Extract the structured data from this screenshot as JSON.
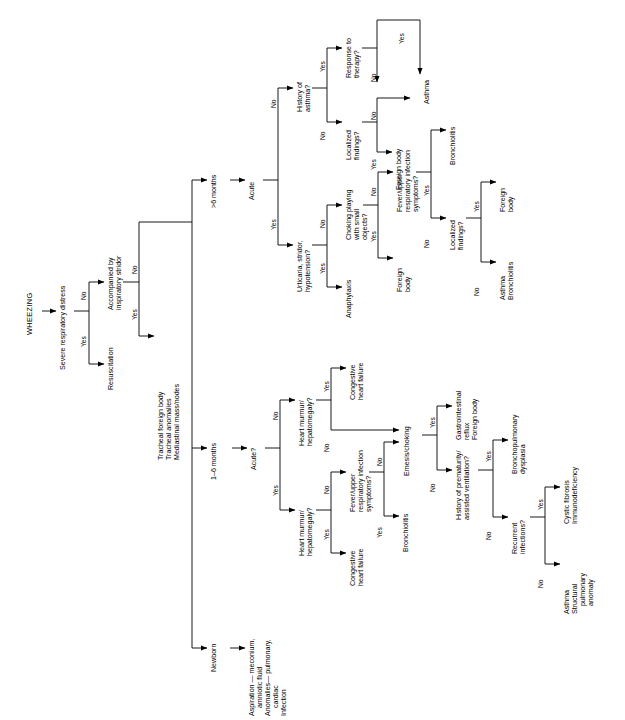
{
  "diagram": {
    "type": "clinical-decision-tree",
    "title": "WHEEZING",
    "orientation": "left-to-right, text rotated 90 degrees counter-clockwise",
    "colors": {
      "line": "#000000",
      "text": "#000000",
      "background": "#ffffff"
    },
    "answers": {
      "yes": "Yes",
      "no": "No"
    }
  },
  "nodes": {
    "root": "WHEEZING",
    "q_severe": "Severe respiratory distress",
    "t_resuscitation": "Resuscitation",
    "q_stridor": "Accompanied by\ninspiratory stridor",
    "t_tracheal": "Tracheal foreign body\nTracheal anomalies\nMediastinal mass/nodes",
    "age_gt6": ">6 months",
    "age_1to6": "1–6 months",
    "age_newborn": "Newborn",
    "t_newborn": "Aspiration — meconium,\n    amniotic fluid\nAnomalies— pulmonary,\n    cardiac\nInfection",
    "q_acute_top": "Acute",
    "q_urticaria": "Urticaria, stridor,\nhypotension?",
    "t_anaphylaxis": "Anaphylaxis",
    "q_choking": "Choking playing\nwith small\nobjects?",
    "t_foreign_body_1": "Foreign\nbody",
    "t_foreign_body_2": "Foreign body",
    "q_fever_uri_top": "Fever/upper\nrespiratory infection\nsymptoms?",
    "t_bronchiolitis_top": "Bronchiolitis",
    "q_localized_top": "Localized\nfindings?",
    "t_foreign_body_3": "Foreign\nbody",
    "t_asthma_bronchiolitis": "Asthma\nBronchiolitis",
    "q_hx_asthma": "History of\nasthma?",
    "q_response": "Response to\ntherapy?",
    "t_asthma_top": "Asthma",
    "q_localized_top2": "Localized\nfindings?",
    "t_foreign_body_top": "Foreign body",
    "q_acute_mid": "Acute?",
    "q_heart_yes": "Heart murmur/\nhepatomegaly?",
    "t_chf_1": "Congestive\nheart failure",
    "q_fever_uri_mid": "Fever/upper\nrespiratory infection\nsymptoms?",
    "t_bronchiolitis_mid": "Bronchiolitis",
    "q_heart_no": "Heart murmur/\nhepatomegaly?",
    "t_chf_2": "Congestive\nheart failure",
    "q_emesis": "Emesis/choking",
    "t_gerd": "Gastrointestinal\nreflux\nForeign body",
    "q_prematurity": "History of prematurity/\nassisted ventilation?",
    "t_bpd": "Bronchopulmonary\ndysplasia",
    "q_recurrent": "Recurrent\ninfections?",
    "t_cf": "Cystic fibrosis\nImmunodeficiency",
    "t_asthma_struct": "Asthma\nStructural\n    pulmonary\n    anomaly"
  },
  "edge_labels": {
    "severe_yes": "Yes",
    "severe_no": "No",
    "stridor_yes": "Yes",
    "stridor_no": "No",
    "acute_top_yes": "Yes",
    "acute_top_no": "No",
    "urticaria_yes": "Yes",
    "urticaria_no": "No",
    "choking_yes": "Yes",
    "choking_no": "No",
    "fever_top_yes": "Yes",
    "fever_top_no": "No",
    "localized_top_yes": "Yes",
    "localized_top_no": "No",
    "hx_asthma_yes": "Yes",
    "hx_asthma_no": "No",
    "response_yes": "Yes",
    "response_no": "No",
    "localized2_yes": "Yes",
    "localized2_no": "No",
    "acute_mid_yes": "Yes",
    "acute_mid_no": "No",
    "heart_yes_yes": "Yes",
    "heart_yes_no": "No",
    "fever_mid_yes": "Yes",
    "fever_mid_no": "No",
    "heart_no_yes": "Yes",
    "heart_no_no": "No",
    "emesis_yes": "Yes",
    "emesis_no": "No",
    "prematurity_yes": "Yes",
    "prematurity_no": "No",
    "recurrent_yes": "Yes",
    "recurrent_no": "No"
  }
}
